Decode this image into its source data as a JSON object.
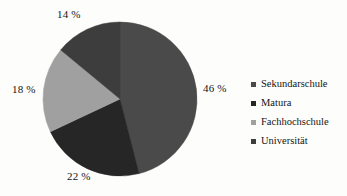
{
  "background_color": "#fdfdfb",
  "text_color": "#141414",
  "chart_data": {
    "type": "pie",
    "title": "",
    "subtitle": "",
    "xlabel": "",
    "ylabel": "",
    "grid": false,
    "legend_position": "right",
    "start_angle_deg": 0,
    "direction": "clockwise",
    "center": {
      "x": 120,
      "y": 99
    },
    "radius": 77,
    "unit": "%",
    "categories": [
      "Sekundarschule",
      "Matura",
      "Fachhochschule",
      "Universität"
    ],
    "values": [
      46,
      22,
      18,
      14
    ],
    "value_labels": [
      "46 %",
      "22 %",
      "18 %",
      "14 %"
    ],
    "colors": [
      "#4a4a4a",
      "#262626",
      "#a0a0a0",
      "#3d3d3d"
    ],
    "slices": [
      {
        "label": "Sekundarschule",
        "value": 46,
        "value_label": "46 %",
        "color": "#4a4a4a",
        "start_deg": 0,
        "end_deg": 165.6
      },
      {
        "label": "Matura",
        "value": 22,
        "value_label": "22 %",
        "color": "#262626",
        "start_deg": 165.6,
        "end_deg": 244.8
      },
      {
        "label": "Fachhochschule",
        "value": 18,
        "value_label": "18 %",
        "color": "#a0a0a0",
        "start_deg": 244.8,
        "end_deg": 309.6
      },
      {
        "label": "Universität",
        "value": 14,
        "value_label": "14 %",
        "color": "#3d3d3d",
        "start_deg": 309.6,
        "end_deg": 360
      }
    ]
  },
  "legend": {
    "items": [
      {
        "label": "Sekundarschule",
        "color": "#4a4a4a"
      },
      {
        "label": "Matura",
        "color": "#262626"
      },
      {
        "label": "Fachhochschule",
        "color": "#a0a0a0"
      },
      {
        "label": "Universität",
        "color": "#3d3d3d"
      }
    ]
  }
}
